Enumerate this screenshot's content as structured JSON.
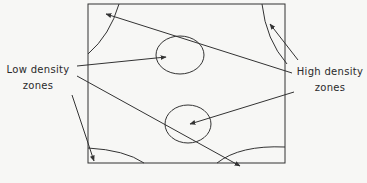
{
  "labels": {
    "low_density": {
      "line1": "Low density",
      "line2": "zones"
    },
    "high_density": {
      "line1": "High density",
      "line2": "zones"
    }
  },
  "colors": {
    "stroke": "#333333",
    "background": "#f7f7f5"
  },
  "shapes": {
    "box": {
      "x": 88,
      "y": 4,
      "width": 197,
      "height": 159
    },
    "high_density_zones": [
      "top-left corner arc",
      "top-right corner arc",
      "bottom-left corner arc",
      "bottom-right corner arc"
    ],
    "low_density_zones": [
      "upper center circle",
      "lower center circle"
    ]
  }
}
